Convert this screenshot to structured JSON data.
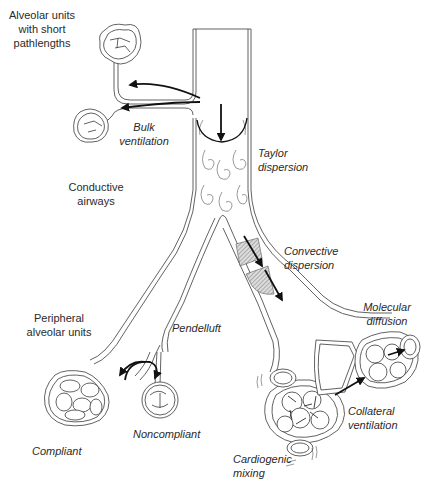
{
  "diagram": {
    "type": "airway-gas-transport-mechanisms",
    "labels": {
      "alveolar_short": [
        "Alveolar units",
        "with short",
        "pathlengths"
      ],
      "bulk_ventilation": [
        "Bulk",
        "ventilation"
      ],
      "taylor_dispersion": [
        "Taylor",
        "dispersion"
      ],
      "conductive_airways": [
        "Conductive",
        "airways"
      ],
      "convective_dispersion": [
        "Convective",
        "dispersion"
      ],
      "peripheral_alveolar": [
        "Peripheral",
        "alveolar units"
      ],
      "pendelluft": "Pendelluft",
      "molecular_diffusion": [
        "Molecular",
        "diffusion"
      ],
      "compliant": "Compliant",
      "noncompliant": "Noncompliant",
      "collateral_ventilation": [
        "Collateral",
        "ventilation"
      ],
      "cardiogenic_mixing": [
        "Cardiogenic",
        "mixing"
      ]
    },
    "colors": {
      "line": "#3a3a3a",
      "arrow": "#111111",
      "text": "#2a2a2a",
      "hatch": "#9a9a9a",
      "background": "#ffffff"
    }
  }
}
